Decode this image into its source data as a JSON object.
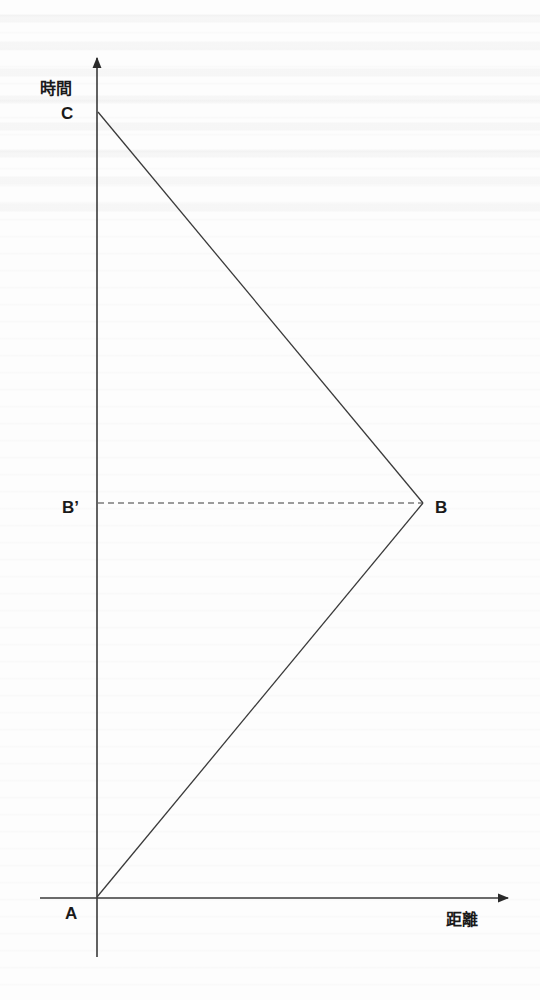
{
  "diagram": {
    "type": "spacetime-diagram",
    "axes": {
      "y_label": "時間",
      "x_label": "距離"
    },
    "points": {
      "A": {
        "label": "A",
        "x": 96,
        "y": 897
      },
      "B": {
        "label": "B",
        "x": 423,
        "y": 503
      },
      "B_prime": {
        "label": "B’",
        "x": 96,
        "y": 503
      },
      "C": {
        "label": "C",
        "x": 98,
        "y": 112
      }
    },
    "segments": [
      {
        "from": "A",
        "to": "B",
        "style": "solid"
      },
      {
        "from": "B",
        "to": "C",
        "style": "solid"
      },
      {
        "from": "B_prime",
        "to": "B",
        "style": "dashed"
      }
    ],
    "colors": {
      "line": "#3a3a3a",
      "text": "#1a1a1a",
      "background": "#fdfdfd"
    }
  }
}
